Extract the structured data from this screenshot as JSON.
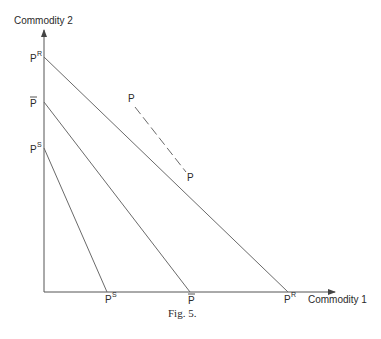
{
  "figure": {
    "caption": "Fig. 5.",
    "y_axis_label": "Commodity 2",
    "x_axis_label": "Commodity 1",
    "colors": {
      "line": "#6a6a6a",
      "axis": "#555555",
      "text": "#2a2a2a"
    }
  },
  "budget_lines": [
    {
      "name": "PR",
      "base": "P",
      "sup": "R",
      "bar": false,
      "y_intercept_label": "P",
      "x_intercept_label": "P"
    },
    {
      "name": "P-bar",
      "base": "P",
      "sup": "",
      "bar": true
    },
    {
      "name": "PS",
      "base": "P",
      "sup": "S",
      "bar": false
    }
  ],
  "labels": {
    "pr_sup": "R",
    "ps_sup": "S",
    "p": "P",
    "dashed_top": "P",
    "dashed_bottom": "P"
  }
}
